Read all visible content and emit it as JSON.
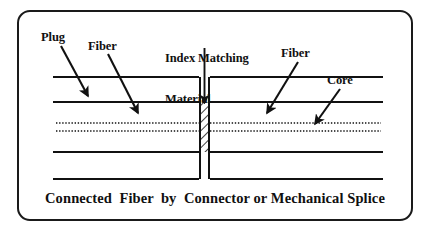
{
  "figure": {
    "caption": "Connected  Fiber  by  Connector or Mechanical Splice",
    "border_color": "#1a1a1a",
    "background": "#ffffff",
    "line_color": "#111111"
  },
  "annotations": {
    "plug": {
      "label": "Plug",
      "x": 41,
      "y": 31
    },
    "fiber_left": {
      "label": "Fiber",
      "x": 88,
      "y": 40
    },
    "index_matching": {
      "line1": "Index Matching",
      "line2": "Material",
      "x": 165,
      "y": 25
    },
    "fiber_right": {
      "label": "Fiber",
      "x": 281,
      "y": 47
    },
    "core": {
      "label": "Core",
      "x": 327,
      "y": 74
    }
  },
  "diagram": {
    "cladding_top_y": 77,
    "core_boundary_top_y": 102,
    "core_dot_upper_y": 123,
    "core_dot_lower_y": 131,
    "core_boundary_bottom_y": 152,
    "cladding_bottom_y": 179,
    "fiber_left_x": 53,
    "fiber_right_x": 383,
    "gap_left_x": 199,
    "gap_right_x": 210,
    "splice_fill": "hatch-diagonal"
  },
  "icons": {
    "arrow_plug": "arrow-down-right-icon",
    "arrow_fiber_left": "arrow-down-right-icon",
    "arrow_index": "arrow-down-icon",
    "arrow_fiber_right": "arrow-down-left-icon",
    "arrow_core": "arrow-down-left-icon"
  }
}
